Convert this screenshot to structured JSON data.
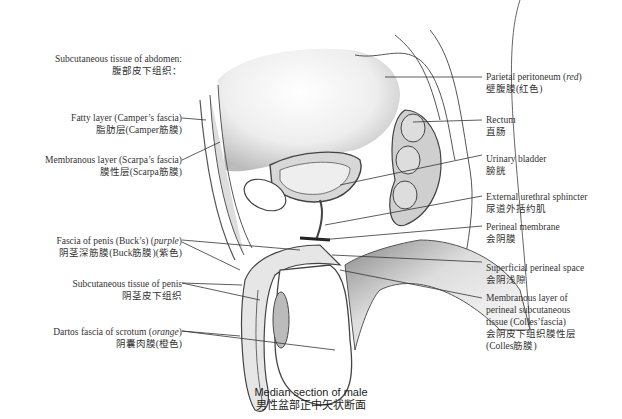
{
  "figure": {
    "caption_en": "Median section of male",
    "caption_zh": "男性盆部正中矢状断面"
  },
  "labels_left": [
    {
      "en": "Subcutaneous tissue of abdomen:",
      "zh": "腹部皮下组织："
    },
    {
      "en": "Fatty layer (Camper’s fascia)",
      "zh": "脂肪层(Camper筋膜)"
    },
    {
      "en": "Membranous layer (Scarpa’s fascia)",
      "zh": "膜性层(Scarpa筋膜)"
    },
    {
      "en": "Fascia of penis (Buck’s)",
      "en_color": "purple",
      "zh": "阴茎深筋膜(Buck筋膜)(紫色)"
    },
    {
      "en": "Subcutaneous tissue of penis",
      "zh": "阴茎皮下组织"
    },
    {
      "en": "Dartos fascia of scrotum",
      "en_color": "orange",
      "zh": "阴囊肉膜(橙色)"
    }
  ],
  "labels_right": [
    {
      "en": "Parietal peritoneum",
      "en_color": "red",
      "zh": "壁腹膜(红色)"
    },
    {
      "en": "Rectum",
      "zh": "直肠"
    },
    {
      "en": "Urinary bladder",
      "zh": "膀胱"
    },
    {
      "en": "External urethral sphincter",
      "zh": "尿道外括约肌"
    },
    {
      "en": "Perineal membrane",
      "zh": "会阴膜"
    },
    {
      "en": "Superficial perineal space",
      "zh": "会阴浅隙"
    },
    {
      "en": "Membranous layer of",
      "en2": "perineal subcutaneous",
      "en3": "tissue (Colles’fascia)",
      "zh": "会阴皮下组织膜性层",
      "zh2": "(Colles筋膜)"
    }
  ]
}
